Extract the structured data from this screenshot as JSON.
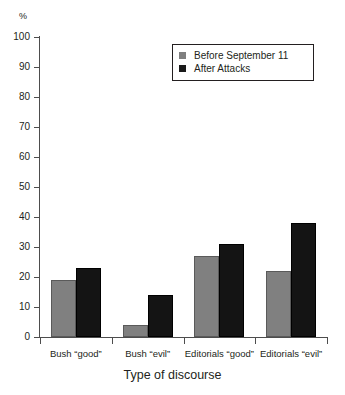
{
  "chart_data": {
    "type": "bar",
    "title": "",
    "subtitle": "",
    "xlabel": "Type of discourse",
    "ylabel": "%",
    "ylim": [
      0,
      100
    ],
    "yticks": [
      0,
      10,
      20,
      30,
      40,
      50,
      60,
      70,
      80,
      90,
      100
    ],
    "ytick_labels": [
      "0",
      "10",
      "20",
      "30",
      "40",
      "50",
      "60",
      "70",
      "80",
      "90",
      "100"
    ],
    "grid": false,
    "legend_position": "upper right",
    "categories": [
      "Bush “good”",
      "Bush “evil”",
      "Editorials “good”",
      "Editorials “evil”"
    ],
    "series": [
      {
        "name": "Before September 11",
        "color": "#808080",
        "values": [
          19,
          4,
          27,
          22
        ]
      },
      {
        "name": "After Attacks",
        "color": "#141414",
        "values": [
          23,
          14,
          31,
          38
        ]
      }
    ]
  },
  "legend": {
    "items": [
      {
        "label": "Before September 11",
        "swatch": "legend-swatch-gray"
      },
      {
        "label": "After Attacks",
        "swatch": "legend-swatch-black"
      }
    ]
  },
  "axes": {
    "y_unit_label": "%",
    "x_axis_title": "Type of discourse"
  }
}
